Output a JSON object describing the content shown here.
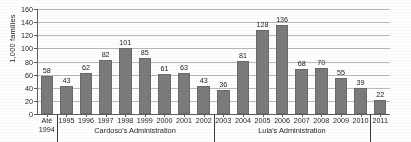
{
  "chart_data": {
    "type": "bar",
    "title": "",
    "subtitle": "",
    "xlabel": "",
    "ylabel": "1,000 families",
    "ylim": [
      0,
      160
    ],
    "ytick_step": 20,
    "yticks": [
      0,
      20,
      40,
      60,
      80,
      100,
      120,
      140,
      160
    ],
    "grid": true,
    "legend": "none",
    "categories": [
      "Até\n1994",
      "1995",
      "1996",
      "1997",
      "1998",
      "1999",
      "2000",
      "2001",
      "2002",
      "2003",
      "2004",
      "2005",
      "2006",
      "2007",
      "2008",
      "2009",
      "2010",
      "2011"
    ],
    "values": [
      58,
      43,
      62,
      82,
      101,
      85,
      61,
      63,
      43,
      36,
      81,
      128,
      136,
      68,
      70,
      55,
      39,
      22
    ],
    "bar_color": "#7b7b7b",
    "annotations": [
      {
        "label": "Cardoso's Administration",
        "from": "1995",
        "to": "2002"
      },
      {
        "label": "Lula's Administration",
        "from": "2003",
        "to": "2010"
      }
    ]
  },
  "axis": {
    "y_title": "1,000 families",
    "y_tick_labels": [
      "0",
      "20",
      "40",
      "60",
      "80",
      "100",
      "120",
      "140",
      "160"
    ]
  },
  "x_categories": [
    {
      "line1": "Até",
      "line2": "1994"
    },
    {
      "line1": "1995",
      "line2": ""
    },
    {
      "line1": "1996",
      "line2": ""
    },
    {
      "line1": "1997",
      "line2": ""
    },
    {
      "line1": "1998",
      "line2": ""
    },
    {
      "line1": "1999",
      "line2": ""
    },
    {
      "line1": "2000",
      "line2": ""
    },
    {
      "line1": "2001",
      "line2": ""
    },
    {
      "line1": "2002",
      "line2": ""
    },
    {
      "line1": "2003",
      "line2": ""
    },
    {
      "line1": "2004",
      "line2": ""
    },
    {
      "line1": "2005",
      "line2": ""
    },
    {
      "line1": "2006",
      "line2": ""
    },
    {
      "line1": "2007",
      "line2": ""
    },
    {
      "line1": "2008",
      "line2": ""
    },
    {
      "line1": "2009",
      "line2": ""
    },
    {
      "line1": "2010",
      "line2": ""
    },
    {
      "line1": "2011",
      "line2": ""
    }
  ],
  "bar_labels": [
    "58",
    "43",
    "62",
    "82",
    "101",
    "85",
    "61",
    "63",
    "43",
    "36",
    "81",
    "128",
    "136",
    "68",
    "70",
    "55",
    "39",
    "22"
  ],
  "groups": [
    {
      "label": "Cardoso's Administration"
    },
    {
      "label": "Lula's Administration"
    }
  ],
  "colors": {
    "bar": "#7b7b7b",
    "gridline": "#b9b9b9",
    "axis": "#5f5f5f",
    "text": "#1f1f1f",
    "background": "#fefefe"
  }
}
